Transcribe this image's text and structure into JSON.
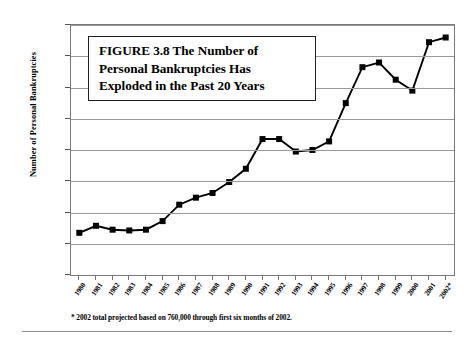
{
  "figure": {
    "title_lines": [
      "FIGURE 3.8  The Number of",
      "Personal Bankruptcies Has",
      "Exploded in the Past 20 Years"
    ],
    "footnote": "* 2002 total projected based on 760,000 through first six months of 2002."
  },
  "chart_data": {
    "type": "line",
    "title": "FIGURE 3.8  The Number of Personal Bankruptcies Has Exploded in the Past 20 Years",
    "xlabel": "",
    "ylabel": "Number of Personal Bankruptcies",
    "ylim": [
      0,
      1600000
    ],
    "ytick_labels": [
      "1,600,000",
      "1,400,000",
      "1,200,000",
      "1,000,000",
      "800,000",
      "600,000",
      "400,000",
      "200,000",
      "0"
    ],
    "ytick_values": [
      1600000,
      1400000,
      1200000,
      1000000,
      800000,
      600000,
      400000,
      200000,
      0
    ],
    "grid": true,
    "legend": "none",
    "marker": "square",
    "series_color": "#000000",
    "categories": [
      "1980",
      "1981",
      "1982",
      "1983",
      "1984",
      "1985",
      "1986",
      "1987",
      "1988",
      "1989",
      "1990",
      "1991",
      "1992",
      "1993",
      "1994",
      "1995",
      "1996",
      "1997",
      "1998",
      "1999",
      "2000",
      "2001",
      "2002*"
    ],
    "values": [
      270000,
      315000,
      290000,
      285000,
      290000,
      345000,
      450000,
      495000,
      525000,
      595000,
      680000,
      870000,
      870000,
      790000,
      800000,
      855000,
      1100000,
      1330000,
      1360000,
      1250000,
      1180000,
      1490000,
      1520000
    ],
    "annotations": [
      "* 2002 total projected based on 760,000 through first six months of 2002."
    ]
  }
}
